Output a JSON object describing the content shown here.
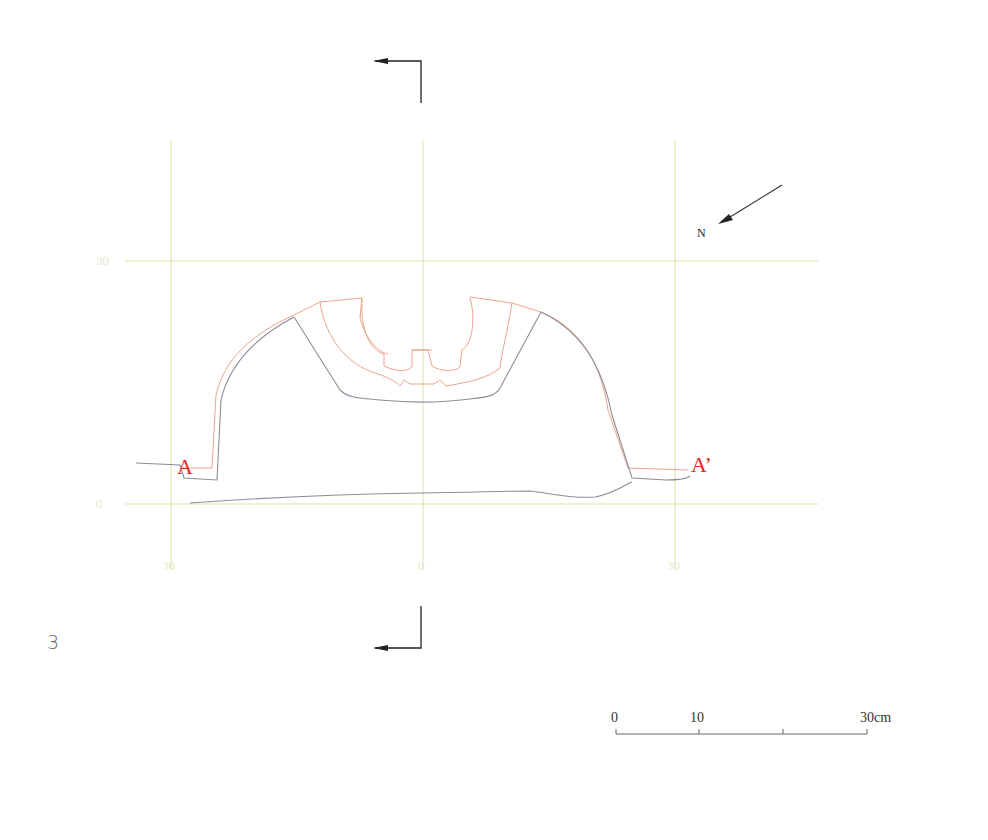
{
  "figure": {
    "number": "3",
    "type": "archaeological plan/section drawing"
  },
  "grid": {
    "color": "#d9dca0",
    "y_labels": [
      "30",
      "0"
    ],
    "x_labels": [
      "30",
      "0",
      "30"
    ]
  },
  "section": {
    "start_label": "A",
    "end_label": "A’",
    "label_color": "#e8231c"
  },
  "north_arrow": {
    "label": "N"
  },
  "scale_bar": {
    "labels": [
      "0",
      "10",
      "30cm"
    ]
  },
  "colors": {
    "outline_gray": "#8a8a9a",
    "outline_orange": "#e8a080",
    "marker_black": "#222222"
  }
}
